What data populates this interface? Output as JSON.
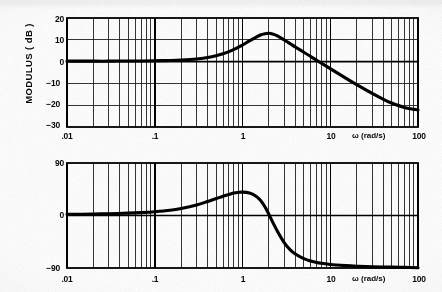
{
  "figure": {
    "type": "bode-plot",
    "background_color": "#ffffff",
    "ink_color": "#101010"
  },
  "modulus_panel": {
    "y_axis_title": "MODULUS  ( dB )",
    "x_axis_unit_label": "ω   (rad/s)",
    "y_ticks": [
      "20",
      "10",
      "0",
      "−10",
      "−20",
      "−30"
    ],
    "x_ticks": [
      ".01",
      ".1",
      "1",
      "10",
      "100"
    ]
  },
  "phase_panel": {
    "y_axis_title": "PHASE  (degree)",
    "x_axis_unit_label": "ω   (rad/s)",
    "y_ticks": [
      "90",
      "0",
      "−90"
    ],
    "x_ticks": [
      ".01",
      ".1",
      "1",
      "10",
      "100"
    ]
  },
  "chart_data": [
    {
      "type": "line",
      "title": "",
      "xlabel": "ω   (rad/s)",
      "ylabel": "MODULUS  ( dB )",
      "xscale": "log",
      "xlim": [
        0.01,
        100
      ],
      "ylim": [
        -30,
        20
      ],
      "xticks": [
        0.01,
        0.1,
        1,
        10,
        100
      ],
      "xticklabels": [
        ".01",
        ".1",
        "1",
        "10",
        "100"
      ],
      "yticks": [
        -30,
        -20,
        -10,
        0,
        10,
        20
      ],
      "yticklabels": [
        "−30",
        "−20",
        "−10",
        "0",
        "10",
        "20"
      ],
      "grid": "log-minor-vertical-and-horizontal",
      "legend": "none",
      "series": [
        {
          "name": "Modulus",
          "x": [
            0.01,
            0.02,
            0.03,
            0.05,
            0.07,
            0.1,
            0.15,
            0.2,
            0.3,
            0.4,
            0.5,
            0.6,
            0.7,
            0.8,
            0.9,
            1.0,
            1.2,
            1.4,
            1.6,
            1.8,
            2.0,
            2.2,
            2.5,
            3.0,
            3.5,
            4.0,
            5.0,
            6.0,
            7.0,
            8.0,
            10.0,
            15.0,
            20.0,
            30.0,
            40.0,
            50.0,
            70.0,
            100.0
          ],
          "y": [
            0.2,
            0.2,
            0.2,
            0.3,
            0.3,
            0.4,
            0.5,
            0.7,
            1.2,
            1.9,
            2.7,
            3.6,
            4.6,
            5.6,
            6.6,
            7.6,
            9.5,
            11.0,
            12.2,
            12.8,
            13.0,
            12.7,
            11.8,
            9.9,
            8.2,
            6.7,
            4.3,
            2.3,
            0.6,
            -0.8,
            -3.2,
            -7.6,
            -10.6,
            -14.6,
            -17.2,
            -19.0,
            -21.0,
            -22.2
          ]
        }
      ],
      "annotations": [
        {
          "text": "peak ≈ 13 dB",
          "at_x": 2.0,
          "at_y": 13.0,
          "visible": false
        }
      ]
    },
    {
      "type": "line",
      "title": "",
      "xlabel": "ω   (rad/s)",
      "ylabel": "PHASE  (degree)",
      "xscale": "log",
      "xlim": [
        0.01,
        100
      ],
      "ylim": [
        -90,
        90
      ],
      "xticks": [
        0.01,
        0.1,
        1,
        10,
        100
      ],
      "xticklabels": [
        ".01",
        ".1",
        "1",
        "10",
        "100"
      ],
      "yticks": [
        -90,
        0,
        90
      ],
      "yticklabels": [
        "−90",
        "0",
        "90"
      ],
      "grid": "log-minor-vertical-and-horizontal",
      "legend": "none",
      "series": [
        {
          "name": "Phase",
          "x": [
            0.01,
            0.02,
            0.03,
            0.05,
            0.07,
            0.1,
            0.15,
            0.2,
            0.3,
            0.4,
            0.5,
            0.6,
            0.7,
            0.8,
            0.9,
            1.0,
            1.2,
            1.4,
            1.6,
            1.8,
            2.0,
            2.2,
            2.5,
            3.0,
            3.5,
            4.0,
            5.0,
            6.0,
            7.0,
            8.0,
            10.0,
            15.0,
            20.0,
            30.0,
            50.0,
            70.0,
            100.0
          ],
          "y": [
            2.0,
            2.5,
            3.0,
            4.0,
            5.0,
            6.5,
            9.0,
            12.0,
            18.0,
            24.0,
            29.0,
            33.0,
            36.0,
            38.5,
            39.5,
            40.0,
            38.5,
            34.0,
            26.0,
            15.0,
            2.0,
            -11.0,
            -27.0,
            -47.0,
            -59.0,
            -66.0,
            -74.0,
            -78.0,
            -80.5,
            -82.0,
            -84.0,
            -86.0,
            -87.0,
            -88.0,
            -88.5,
            -89.0,
            -89.5
          ]
        }
      ]
    }
  ]
}
